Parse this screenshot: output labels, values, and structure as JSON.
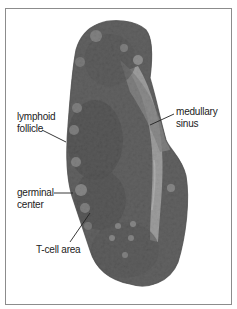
{
  "figure": {
    "frame_color": "#8c8c8c",
    "background_color": "#ffffff",
    "tissue_colors": {
      "dark": "#3a3a3a",
      "mid": "#5e5e5e",
      "light": "#a8a8a8",
      "sinus": "#d8d8d8"
    }
  },
  "labels": {
    "lymphoid_follicle": {
      "line1": "lymphoid",
      "line2": "follicle"
    },
    "medullary_sinus": {
      "line1": "medullary",
      "line2": "sinus"
    },
    "germinal_center": {
      "line1": "germinal",
      "line2": "center"
    },
    "t_cell_area": {
      "line1": "T-cell area"
    }
  }
}
